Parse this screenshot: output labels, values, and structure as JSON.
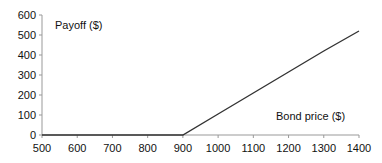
{
  "chart_data": {
    "type": "line",
    "title": "",
    "xlabel": "Bond price ($)",
    "ylabel": "Payoff ($)",
    "x": [
      500,
      600,
      700,
      800,
      900,
      1000,
      1100,
      1200,
      1300,
      1400
    ],
    "series": [
      {
        "name": "Payoff",
        "values": [
          0,
          0,
          0,
          0,
          0,
          105,
          210,
          315,
          420,
          520
        ]
      }
    ],
    "xlim": [
      500,
      1400
    ],
    "ylim": [
      0,
      600
    ],
    "xticks": [
      500,
      600,
      700,
      800,
      900,
      1000,
      1100,
      1200,
      1300,
      1400
    ],
    "yticks": [
      0,
      100,
      200,
      300,
      400,
      500,
      600
    ],
    "grid": false,
    "legend": null,
    "colors": {
      "line": "#333333",
      "axis": "#999999",
      "text": "#111111"
    }
  }
}
